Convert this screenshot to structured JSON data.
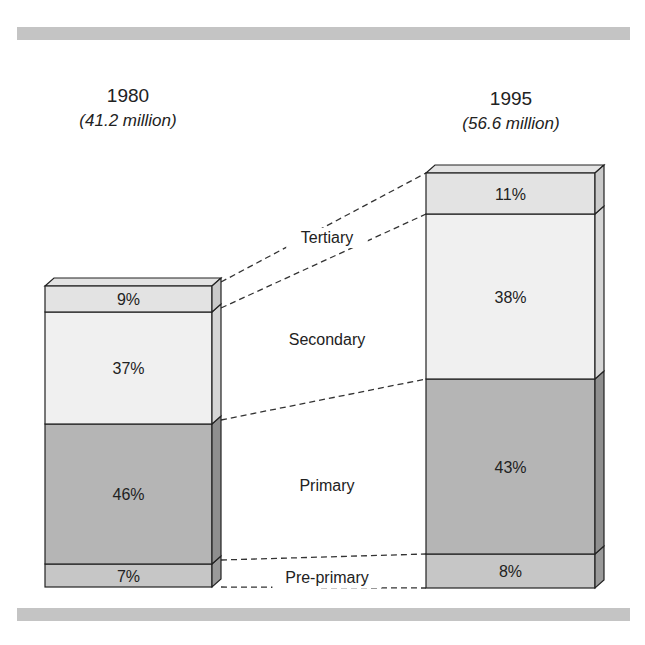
{
  "chart_data": {
    "type": "bar",
    "subtype": "stacked-100-percent-3d",
    "title": "",
    "categories": [
      "1980",
      "1995"
    ],
    "totals": [
      "(41.2 million)",
      "(56.6 million)"
    ],
    "series": [
      {
        "name": "Pre-primary",
        "values": [
          7,
          8
        ],
        "color": "#c6c6c6"
      },
      {
        "name": "Primary",
        "values": [
          46,
          43
        ],
        "color": "#b5b5b5"
      },
      {
        "name": "Secondary",
        "values": [
          37,
          38
        ],
        "color": "#f0f0f0"
      },
      {
        "name": "Tertiary",
        "values": [
          9,
          11
        ],
        "color": "#e3e3e3"
      }
    ],
    "value_labels": {
      "1980": [
        "7%",
        "46%",
        "37%",
        "9%"
      ],
      "1995": [
        "8%",
        "43%",
        "38%",
        "11%"
      ]
    },
    "series_labels_between_bars": [
      "Tertiary",
      "Secondary",
      "Primary",
      "Pre-primary"
    ],
    "xlabel": "",
    "ylabel": "",
    "grid": false,
    "legend": "inline labels between bars with dashed connector lines"
  },
  "header": {
    "left": {
      "year": "1980",
      "total": "(41.2 million)"
    },
    "right": {
      "year": "1995",
      "total": "(56.6 million)"
    }
  },
  "bars": [
    {
      "id": "1980",
      "x": 45,
      "w": 167,
      "bottom": 587,
      "segments": [
        {
          "name": "Pre-primary",
          "label": "7%",
          "top": 564,
          "color": "#c6c6c6",
          "side": "#9a9a9a"
        },
        {
          "name": "Primary",
          "label": "46%",
          "top": 424,
          "color": "#b5b5b5",
          "side": "#8f8f8f"
        },
        {
          "name": "Secondary",
          "label": "37%",
          "top": 312,
          "color": "#f0f0f0",
          "side": "#d6d6d6"
        },
        {
          "name": "Tertiary",
          "label": "9%",
          "top": 286,
          "color": "#e3e3e3",
          "side": "#cacaca"
        }
      ]
    },
    {
      "id": "1995",
      "x": 426,
      "w": 169,
      "bottom": 588,
      "segments": [
        {
          "name": "Pre-primary",
          "label": "8%",
          "top": 554,
          "color": "#c6c6c6",
          "side": "#9a9a9a"
        },
        {
          "name": "Primary",
          "label": "43%",
          "top": 379,
          "color": "#b5b5b5",
          "side": "#8f8f8f"
        },
        {
          "name": "Secondary",
          "label": "38%",
          "top": 214,
          "color": "#f0f0f0",
          "side": "#d6d6d6"
        },
        {
          "name": "Tertiary",
          "label": "11%",
          "top": 173,
          "color": "#e3e3e3",
          "side": "#cacaca"
        }
      ]
    }
  ],
  "middle_labels": [
    {
      "text": "Tertiary",
      "x": 327,
      "y": 243
    },
    {
      "text": "Secondary",
      "x": 327,
      "y": 345
    },
    {
      "text": "Primary",
      "x": 327,
      "y": 491
    },
    {
      "text": "Pre-primary",
      "x": 327,
      "y": 583
    }
  ],
  "depth": {
    "dx": 9,
    "dy": 8
  }
}
